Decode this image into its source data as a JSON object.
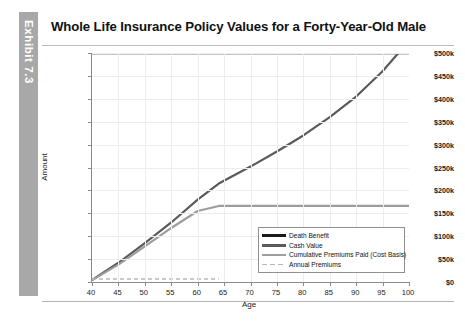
{
  "exhibit": {
    "tab_label": "Exhibit 7.3"
  },
  "header": {
    "title": "Whole Life Insurance Policy Values for a Forty-Year-Old Male"
  },
  "chart_data": {
    "type": "line",
    "title": "Whole Life Insurance Policy Values for a Forty-Year-Old Male",
    "xlabel": "Age",
    "ylabel": "Amount",
    "xlim": [
      40,
      100
    ],
    "ylim": [
      0,
      500000
    ],
    "xticks": [
      40,
      45,
      50,
      55,
      60,
      65,
      70,
      75,
      80,
      85,
      90,
      95,
      100
    ],
    "xtick_labels": [
      "40",
      "45",
      "50",
      "55",
      "60",
      "65",
      "70",
      "75",
      "80",
      "85",
      "90",
      "95",
      "100"
    ],
    "yticks": [
      0,
      50000,
      100000,
      150000,
      200000,
      250000,
      300000,
      350000,
      400000,
      450000,
      500000
    ],
    "ytick_labels": [
      "$0",
      "$50k",
      "$100k",
      "$150k",
      "$200k",
      "$250k",
      "$300k",
      "$350k",
      "$400k",
      "$450k",
      "$500k"
    ],
    "grid": true,
    "legend_position": "lower right",
    "x": [
      40,
      45,
      50,
      55,
      60,
      64,
      70,
      75,
      80,
      85,
      90,
      95,
      98,
      100
    ],
    "series": [
      {
        "name": "Death Benefit",
        "color": "#1a1a1a",
        "width": 2.6,
        "style": "solid",
        "values": [
          500000,
          500000,
          500000,
          500000,
          500000,
          500000,
          500000,
          500000,
          500000,
          500000,
          500000,
          500000,
          500000,
          500000
        ]
      },
      {
        "name": "Cash Value",
        "color": "#5a5a5a",
        "width": 2.2,
        "style": "solid",
        "values": [
          4000,
          42000,
          85000,
          130000,
          180000,
          215000,
          252000,
          285000,
          320000,
          360000,
          405000,
          460000,
          500000,
          500000
        ]
      },
      {
        "name": "Cumulative Premiums Paid (Cost Basis)",
        "color": "#9d9d9d",
        "width": 2.2,
        "style": "solid",
        "values": [
          4000,
          38000,
          78000,
          118000,
          155000,
          166000,
          166000,
          166000,
          166000,
          166000,
          166000,
          166000,
          166000,
          166000
        ]
      },
      {
        "name": "Annual Premiums",
        "color": "#b8b8b8",
        "width": 1.6,
        "style": "dashed",
        "values": [
          6500,
          6500,
          6500,
          6500,
          6500,
          6500,
          0,
          0,
          0,
          0,
          0,
          0,
          0,
          0
        ]
      }
    ],
    "legend": [
      {
        "label": "Death Benefit",
        "color": "#1a1a1a",
        "style": "solid",
        "thickness": 3.2
      },
      {
        "label": "Cash Value",
        "color": "#5a5a5a",
        "style": "solid",
        "thickness": 2.8
      },
      {
        "label": "Cumulative Premiums Paid (Cost Basis)",
        "color": "#9d9d9d",
        "style": "solid",
        "thickness": 2.6
      },
      {
        "label": "Annual Premiums",
        "color": "#b8b8b8",
        "style": "dashed",
        "thickness": 1.8
      }
    ]
  }
}
